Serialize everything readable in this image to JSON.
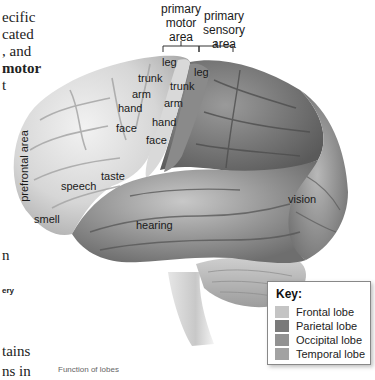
{
  "page_text": {
    "left_lines": [
      "ecific",
      "cated",
      ", and",
      "motor",
      "t"
    ],
    "bold_line_index": 3,
    "lower_fragments": [
      "n",
      "ery",
      "tains",
      "ns in"
    ],
    "caption": "Function of lobes"
  },
  "diagram": {
    "headers": {
      "motor": [
        "primary",
        "motor",
        "area"
      ],
      "sensory": [
        "primary",
        "sensory",
        "area"
      ]
    },
    "motor_labels": [
      "leg",
      "trunk",
      "arm",
      "hand",
      "face"
    ],
    "sensory_labels": [
      "leg",
      "trunk",
      "arm",
      "hand",
      "face"
    ],
    "region_labels": {
      "prefrontal": "prefrontal area",
      "speech": "speech",
      "taste": "taste",
      "smell": "smell",
      "hearing": "hearing",
      "vision": "vision"
    }
  },
  "key": {
    "title": "Key:",
    "items": [
      {
        "label": "Frontal lobe",
        "color": "#c4c4c4"
      },
      {
        "label": "Parietal lobe",
        "color": "#7a7a7a"
      },
      {
        "label": "Occipital lobe",
        "color": "#929292"
      },
      {
        "label": "Temporal lobe",
        "color": "#a2a2a2"
      }
    ]
  }
}
